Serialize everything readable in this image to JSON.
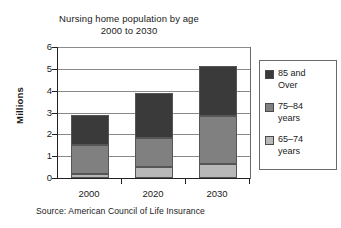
{
  "chart_data": {
    "type": "bar",
    "subtype": "stacked-vertical",
    "title": "Nursing home population by age",
    "subtitle": "2000 to 2030",
    "xlabel": "",
    "ylabel": "Millions",
    "categories": [
      "2000",
      "2020",
      "2030"
    ],
    "series": [
      {
        "name": "65–74 years",
        "values": [
          0.2,
          0.5,
          0.65
        ],
        "color": "#b8b8b8"
      },
      {
        "name": "75–84 years",
        "values": [
          1.3,
          1.35,
          2.2
        ],
        "color": "#808080"
      },
      {
        "name": "85 and Over",
        "values": [
          1.4,
          2.05,
          2.3
        ],
        "color": "#3a3a3a"
      }
    ],
    "totals": [
      2.9,
      3.9,
      5.15
    ],
    "ylim": [
      0,
      6
    ],
    "yticks": [
      0,
      1,
      2,
      3,
      4,
      5,
      6
    ],
    "ytick_labels": [
      "0",
      "1",
      "2",
      "3",
      "4",
      "5",
      "6"
    ],
    "grid": true,
    "legend_position": "right",
    "source": "Source: American Council of Life Insurance"
  },
  "title": {
    "line1": "Nursing home population by age",
    "line2": "2000 to 2030"
  },
  "axes": {
    "y_title": "Millions",
    "y_labels": [
      "6",
      "5",
      "4",
      "3",
      "2",
      "1",
      "0"
    ],
    "x_labels": [
      "2000",
      "2020",
      "2030"
    ]
  },
  "legend": {
    "items": [
      {
        "label_line1": "85 and",
        "label_line2": "Over",
        "color": "#3a3a3a"
      },
      {
        "label_line1": "75–84",
        "label_line2": "years",
        "color": "#808080"
      },
      {
        "label_line1": "65–74",
        "label_line2": "years",
        "color": "#b8b8b8"
      }
    ]
  },
  "footer": {
    "source": "Source: American Council of Life Insurance"
  }
}
